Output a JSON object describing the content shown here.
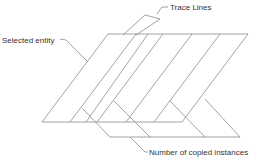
{
  "diagram": {
    "labels": {
      "trace_lines": "Trace Lines",
      "selected_entity": "Selected entity",
      "copied_instances": "Number of copied instances"
    },
    "line_color": "#8a8a8a"
  }
}
